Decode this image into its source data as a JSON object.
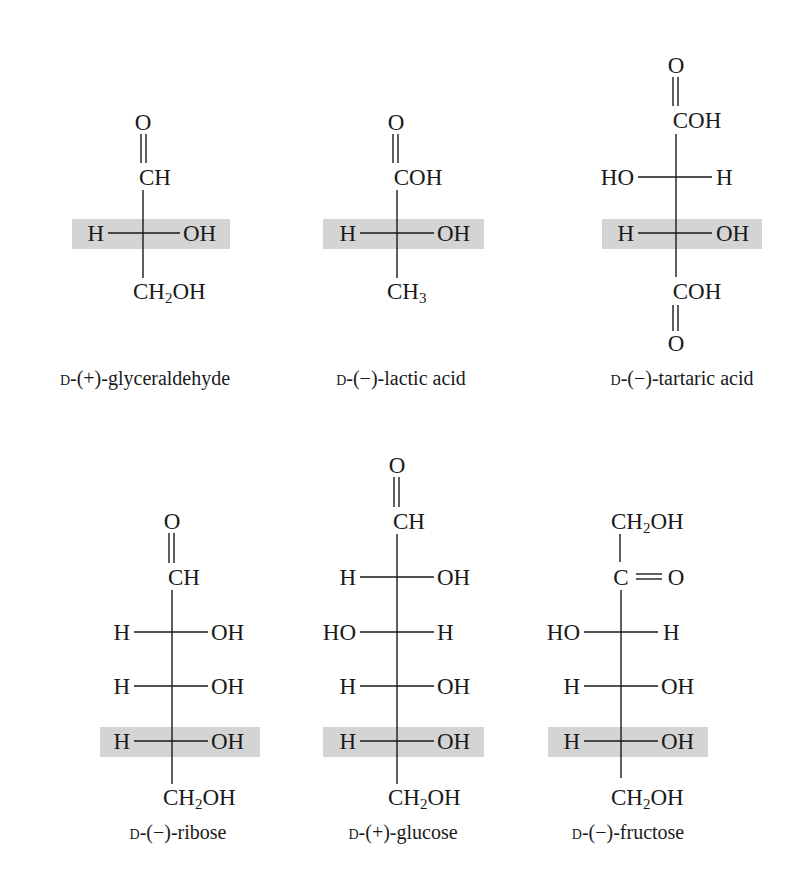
{
  "figure": {
    "highlight_color": "#d4d4d4",
    "text_color": "#1a1a1a"
  },
  "molecules": [
    {
      "id": "glyceraldehyde",
      "label_prefix": "D",
      "label_rest": "-(+)-glyceraldehyde",
      "top_o": "O",
      "top": "CH",
      "rows": [
        {
          "left": "H",
          "right": "OH",
          "highlighted": true
        }
      ],
      "bottom_main": "CH",
      "bottom_sub": "2",
      "bottom_tail": "OH"
    },
    {
      "id": "lactic-acid",
      "label_prefix": "D",
      "label_rest": "-(−)-lactic acid",
      "top_o": "O",
      "top": "COH",
      "rows": [
        {
          "left": "H",
          "right": "OH",
          "highlighted": true
        }
      ],
      "bottom_main": "CH",
      "bottom_sub": "3",
      "bottom_tail": ""
    },
    {
      "id": "tartaric-acid",
      "label_prefix": "D",
      "label_rest": "-(−)-tartaric acid",
      "top_o": "O",
      "top": "COH",
      "rows": [
        {
          "left": "HO",
          "right": "H",
          "highlighted": false
        },
        {
          "left": "H",
          "right": "OH",
          "highlighted": true
        }
      ],
      "bottom": "COH",
      "bottom_o": "O"
    },
    {
      "id": "ribose",
      "label_prefix": "D",
      "label_rest": "-(−)-ribose",
      "top_o": "O",
      "top": "CH",
      "rows": [
        {
          "left": "H",
          "right": "OH",
          "highlighted": false
        },
        {
          "left": "H",
          "right": "OH",
          "highlighted": false
        },
        {
          "left": "H",
          "right": "OH",
          "highlighted": true
        }
      ],
      "bottom_main": "CH",
      "bottom_sub": "2",
      "bottom_tail": "OH"
    },
    {
      "id": "glucose",
      "label_prefix": "D",
      "label_rest": "-(+)-glucose",
      "top_o": "O",
      "top": "CH",
      "rows": [
        {
          "left": "H",
          "right": "OH",
          "highlighted": false
        },
        {
          "left": "HO",
          "right": "H",
          "highlighted": false
        },
        {
          "left": "H",
          "right": "OH",
          "highlighted": false
        },
        {
          "left": "H",
          "right": "OH",
          "highlighted": true
        }
      ],
      "bottom_main": "CH",
      "bottom_sub": "2",
      "bottom_tail": "OH"
    },
    {
      "id": "fructose",
      "label_prefix": "D",
      "label_rest": "-(−)-fructose",
      "top_main": "CH",
      "top_sub": "2",
      "top_tail": "OH",
      "carbonyl_c": "C",
      "carbonyl_o": "O",
      "rows": [
        {
          "left": "HO",
          "right": "H",
          "highlighted": false
        },
        {
          "left": "H",
          "right": "OH",
          "highlighted": false
        },
        {
          "left": "H",
          "right": "OH",
          "highlighted": true
        }
      ],
      "bottom_main": "CH",
      "bottom_sub": "2",
      "bottom_tail": "OH"
    }
  ]
}
